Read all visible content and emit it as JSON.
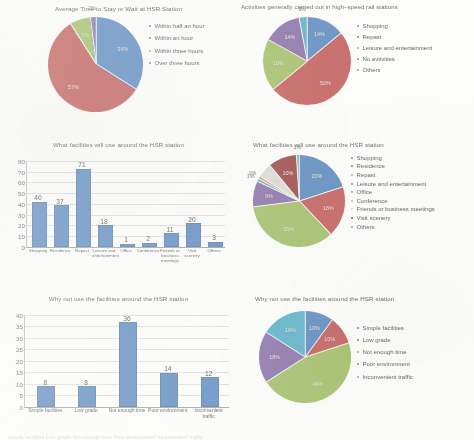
{
  "palette": {
    "blue": "#4f81bd",
    "red": "#c0504d",
    "green": "#9bbb59",
    "purple": "#8064a2",
    "teal": "#4bacc6",
    "orange": "#f79646",
    "dark_red": "#953735",
    "dark_blue": "#1f497d",
    "grey": "#d9d9d9",
    "bar_blue": "#4f81bd",
    "gridline": "#dedede",
    "axis": "#9a9a9a"
  },
  "caption": {
    "text": "simple facilities        Low grade        Not enough time     Poor environment    Inconvenient traffic"
  },
  "charts": [
    {
      "id": "avg-time-pie",
      "type": "pie",
      "title": "Average Time to Stay or Wait at HSR Station",
      "categories": [
        "Within half an hour",
        "Within an hour",
        "Within three hours",
        "Over three hours"
      ],
      "values": [
        34,
        57,
        7,
        2
      ],
      "labels": [
        "34%",
        "57%",
        "7%",
        "2%"
      ],
      "colors": [
        "#4f81bd",
        "#c0504d",
        "#9bbb59",
        "#8064a2"
      ],
      "legend_position": "right"
    },
    {
      "id": "activities-pie",
      "type": "pie",
      "title": "Activities generally carried out in high–speed rail stations",
      "categories": [
        "Shopping",
        "Repast",
        "Leisure and entertainment",
        "No avtivities",
        "Others"
      ],
      "values": [
        14,
        50,
        19,
        14,
        3
      ],
      "labels": [
        "14%",
        "50%",
        "19%",
        "14%",
        "3%"
      ],
      "colors": [
        "#4f81bd",
        "#c0504d",
        "#9bbb59",
        "#8064a2",
        "#4bacc6"
      ],
      "legend_position": "right"
    },
    {
      "id": "facilities-bar",
      "type": "bar",
      "title": "What facilities will use around the HSR station",
      "categories": [
        "Shopping",
        "Residence",
        "Repast",
        "Leisure and entertainment",
        "Office",
        "Conference",
        "Friends or business meetings",
        "Visit scenery",
        "Others"
      ],
      "values": [
        40,
        37,
        71,
        18,
        1,
        2,
        11,
        20,
        3
      ],
      "xlabel": "",
      "ylabel": "",
      "ylim": [
        0,
        80
      ],
      "yticks": [
        0,
        10,
        20,
        30,
        40,
        50,
        60,
        70,
        80
      ],
      "grid": true
    },
    {
      "id": "facilities-pie",
      "type": "pie",
      "title": "What facilities will use around the HSR station",
      "categories": [
        "Shopping",
        "Residence",
        "Repast",
        "Leisure and entertainment",
        "Office",
        "Conference",
        "Friends or business meetings",
        "Visit scenery",
        "Others"
      ],
      "values": [
        20,
        18,
        35,
        9,
        1,
        1,
        5,
        10,
        1
      ],
      "labels": [
        "20%",
        "18%",
        "35%",
        "9%",
        "1%",
        "1%",
        "5%",
        "10%",
        "1%"
      ],
      "colors": [
        "#4f81bd",
        "#c0504d",
        "#9bbb59",
        "#8064a2",
        "#4bacc6",
        "#f79646",
        "#d9d9d9",
        "#953735",
        "#4bacc6"
      ],
      "legend_position": "right"
    },
    {
      "id": "why-not-bar",
      "type": "bar",
      "title": "Why not use the facilities around the HSR station",
      "categories": [
        "Simple facilities",
        "Low grade",
        "Not enough time",
        "Poor environment",
        "Inconvenient traffic"
      ],
      "values": [
        8,
        8,
        36,
        14,
        12
      ],
      "xlabel": "",
      "ylabel": "",
      "ylim": [
        0,
        40
      ],
      "yticks": [
        0,
        5,
        10,
        15,
        20,
        25,
        30,
        35,
        40
      ],
      "grid": true
    },
    {
      "id": "why-not-pie",
      "type": "pie",
      "title": "Why not use the facilities around the HSR station",
      "categories": [
        "Simple facilities",
        "Low grade",
        "Not enough time",
        "Poor environment",
        "Inconvenient traffic"
      ],
      "values": [
        10,
        10,
        46,
        18,
        16
      ],
      "labels": [
        "10%",
        "10%",
        "46%",
        "18%",
        "16%"
      ],
      "colors": [
        "#4f81bd",
        "#c0504d",
        "#9bbb59",
        "#8064a2",
        "#4bacc6"
      ],
      "legend_position": "right"
    }
  ],
  "chart_data": [
    {
      "type": "pie",
      "title": "Average Time to Stay or Wait at HSR Station",
      "categories": [
        "Within half an hour",
        "Within an hour",
        "Within three hours",
        "Over three hours"
      ],
      "values": [
        34,
        57,
        7,
        2
      ],
      "unit": "percent",
      "legend_position": "right",
      "grid": false
    },
    {
      "type": "pie",
      "title": "Activities generally carried out in high–speed rail stations",
      "categories": [
        "Shopping",
        "Repast",
        "Leisure and entertainment",
        "No avtivities",
        "Others"
      ],
      "values": [
        14,
        50,
        19,
        14,
        3
      ],
      "unit": "percent",
      "legend_position": "right",
      "grid": false
    },
    {
      "type": "bar",
      "title": "What facilities will use around the HSR station",
      "categories": [
        "Shopping",
        "Residence",
        "Repast",
        "Leisure and entertainment",
        "Office",
        "Conference",
        "Friends or business meetings",
        "Visit scenery",
        "Others"
      ],
      "values": [
        40,
        37,
        71,
        18,
        1,
        2,
        11,
        20,
        3
      ],
      "xlabel": "",
      "ylabel": "",
      "ylim": [
        0,
        80
      ],
      "grid": true
    },
    {
      "type": "pie",
      "title": "What facilities will use around the HSR station",
      "categories": [
        "Shopping",
        "Residence",
        "Repast",
        "Leisure and entertainment",
        "Office",
        "Conference",
        "Friends or business meetings",
        "Visit scenery",
        "Others"
      ],
      "values": [
        20,
        18,
        35,
        9,
        1,
        1,
        5,
        10,
        1
      ],
      "unit": "percent",
      "legend_position": "right",
      "grid": false
    },
    {
      "type": "bar",
      "title": "Why not use the facilities around the HSR station",
      "categories": [
        "Simple facilities",
        "Low grade",
        "Not enough time",
        "Poor environment",
        "Inconvenient traffic"
      ],
      "values": [
        8,
        8,
        36,
        14,
        12
      ],
      "xlabel": "",
      "ylabel": "",
      "ylim": [
        0,
        40
      ],
      "grid": true
    },
    {
      "type": "pie",
      "title": "Why not use the facilities around the HSR station",
      "categories": [
        "Simple facilities",
        "Low grade",
        "Not enough time",
        "Poor environment",
        "Inconvenient traffic"
      ],
      "values": [
        10,
        10,
        46,
        18,
        16
      ],
      "unit": "percent",
      "legend_position": "right",
      "grid": false
    }
  ]
}
